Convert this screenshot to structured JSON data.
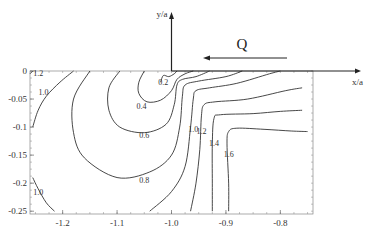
{
  "chart_data": {
    "type": "contour",
    "title": "",
    "xlabel": "x/a",
    "ylabel": "y/a",
    "annotation": "Q",
    "annotation_arrow_direction": "left",
    "xlim": [
      -1.26,
      -0.74
    ],
    "ylim": [
      -0.255,
      0
    ],
    "x_ticks": [
      -1.2,
      -1.1,
      -1.0,
      -0.9,
      -0.8
    ],
    "x_tick_labels": [
      "-1.2",
      "-1.1",
      "-1.0",
      "-0.9",
      "-0.8"
    ],
    "y_ticks": [
      0,
      -0.05,
      -0.1,
      -0.15,
      -0.2,
      -0.25
    ],
    "y_tick_labels": [
      "0",
      "-0.05",
      "-0.1",
      "-0.15",
      "-0.2",
      "-0.25"
    ],
    "grid": false,
    "contour_levels": [
      {
        "level": "0.2",
        "label": "0.2",
        "points": [
          [
            -1.02,
            -0.02
          ],
          [
            -1.015,
            -0.008
          ],
          [
            -1.005,
            -0.01
          ],
          [
            -0.995,
            -0.005
          ],
          [
            -0.99,
            0
          ]
        ]
      },
      {
        "level": "0.4",
        "label": "0.4",
        "points": [
          [
            -1.05,
            0
          ],
          [
            -1.06,
            -0.02
          ],
          [
            -1.06,
            -0.04
          ],
          [
            -1.045,
            -0.055
          ],
          [
            -1.02,
            -0.052
          ],
          [
            -1.0,
            -0.035
          ],
          [
            -0.99,
            -0.015
          ],
          [
            -0.975,
            -0.005
          ],
          [
            -0.96,
            0
          ]
        ]
      },
      {
        "level": "0.6",
        "label": "0.6",
        "points": [
          [
            -1.095,
            0
          ],
          [
            -1.115,
            -0.03
          ],
          [
            -1.115,
            -0.07
          ],
          [
            -1.095,
            -0.1
          ],
          [
            -1.05,
            -0.11
          ],
          [
            -1.01,
            -0.095
          ],
          [
            -0.995,
            -0.06
          ],
          [
            -0.99,
            -0.025
          ],
          [
            -0.98,
            -0.015
          ],
          [
            -0.955,
            -0.01
          ],
          [
            -0.93,
            0
          ]
        ]
      },
      {
        "level": "0.8",
        "label": "0.8",
        "points": [
          [
            -1.15,
            0
          ],
          [
            -1.18,
            -0.05
          ],
          [
            -1.18,
            -0.11
          ],
          [
            -1.16,
            -0.155
          ],
          [
            -1.1,
            -0.19
          ],
          [
            -1.04,
            -0.18
          ],
          [
            -1.0,
            -0.15
          ],
          [
            -0.985,
            -0.1
          ],
          [
            -0.98,
            -0.045
          ],
          [
            -0.975,
            -0.025
          ],
          [
            -0.95,
            -0.018
          ],
          [
            -0.9,
            -0.01
          ],
          [
            -0.87,
            0
          ]
        ]
      },
      {
        "level": "1.0",
        "label": "1.0",
        "points": [
          [
            -1.04,
            -0.25
          ],
          [
            -1.0,
            -0.215
          ],
          [
            -0.975,
            -0.17
          ],
          [
            -0.965,
            -0.1
          ],
          [
            -0.96,
            -0.05
          ],
          [
            -0.955,
            -0.035
          ],
          [
            -0.93,
            -0.03
          ],
          [
            -0.88,
            -0.022
          ],
          [
            -0.82,
            -0.005
          ],
          [
            -0.8,
            0
          ]
        ]
      },
      {
        "level": "1.0",
        "label": "1.0",
        "points": [
          [
            -1.255,
            -0.1
          ],
          [
            -1.245,
            -0.07
          ],
          [
            -1.23,
            -0.045
          ],
          [
            -1.205,
            -0.02
          ],
          [
            -1.18,
            0
          ]
        ]
      },
      {
        "level": "1.0",
        "label": "1.0",
        "points": [
          [
            -1.255,
            -0.19
          ],
          [
            -1.245,
            -0.21
          ],
          [
            -1.23,
            -0.235
          ],
          [
            -1.215,
            -0.25
          ]
        ]
      },
      {
        "level": "1.2",
        "label": "1.2",
        "points": [
          [
            -0.965,
            -0.25
          ],
          [
            -0.955,
            -0.2
          ],
          [
            -0.948,
            -0.14
          ],
          [
            -0.945,
            -0.08
          ],
          [
            -0.94,
            -0.06
          ],
          [
            -0.92,
            -0.055
          ],
          [
            -0.86,
            -0.05
          ],
          [
            -0.79,
            -0.035
          ],
          [
            -0.76,
            -0.03
          ]
        ]
      },
      {
        "level": "1.4",
        "label": "1.4",
        "points": [
          [
            -0.925,
            -0.25
          ],
          [
            -0.925,
            -0.2
          ],
          [
            -0.925,
            -0.13
          ],
          [
            -0.922,
            -0.085
          ],
          [
            -0.91,
            -0.078
          ],
          [
            -0.85,
            -0.076
          ],
          [
            -0.8,
            -0.072
          ],
          [
            -0.76,
            -0.07
          ]
        ]
      },
      {
        "level": "1.6",
        "label": "1.6",
        "points": [
          [
            -0.895,
            -0.25
          ],
          [
            -0.895,
            -0.2
          ],
          [
            -0.898,
            -0.13
          ],
          [
            -0.895,
            -0.108
          ],
          [
            -0.88,
            -0.102
          ],
          [
            -0.83,
            -0.104
          ],
          [
            -0.78,
            -0.107
          ],
          [
            -0.75,
            -0.108
          ]
        ]
      },
      {
        "level": "1.2",
        "label": "1.2",
        "points": [
          [
            -1.26,
            -0.005
          ],
          [
            -1.255,
            0
          ]
        ]
      }
    ],
    "contour_label_positions": [
      {
        "label": "1.2",
        "x": -1.245,
        "y": -0.009
      },
      {
        "label": "1.0",
        "x": -1.235,
        "y": -0.042
      },
      {
        "label": "0.2",
        "x": -1.015,
        "y": -0.025
      },
      {
        "label": "0.4",
        "x": -1.055,
        "y": -0.068
      },
      {
        "label": "0.6",
        "x": -1.05,
        "y": -0.12
      },
      {
        "label": "0.8",
        "x": -1.05,
        "y": -0.2
      },
      {
        "label": "1.0",
        "x": -0.96,
        "y": -0.108
      },
      {
        "label": "1.2",
        "x": -0.945,
        "y": -0.113
      },
      {
        "label": "1.4",
        "x": -0.922,
        "y": -0.133
      },
      {
        "label": "1.6",
        "x": -0.895,
        "y": -0.153
      },
      {
        "label": "1.0",
        "x": -1.245,
        "y": -0.222
      }
    ]
  }
}
